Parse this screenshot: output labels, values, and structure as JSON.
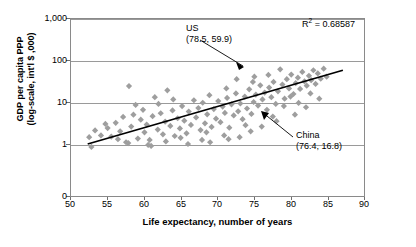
{
  "chart_data": {
    "type": "scatter",
    "title": "",
    "xlabel": "Life expectancy, number of years",
    "ylabel": "GDP per capita PPP (log-scale, int'l $ ,000)",
    "ylabel_line1": "GDP per capita PPP",
    "ylabel_line2": "(log-scale, int'l $ ,000)",
    "xlim": [
      50,
      90
    ],
    "ylim_log": [
      1,
      1000
    ],
    "x_ticks": [
      50,
      55,
      60,
      65,
      70,
      75,
      80,
      85,
      90
    ],
    "x_tick_labels": [
      "50",
      "55",
      "60",
      "65",
      "70",
      "75",
      "80",
      "85",
      "90"
    ],
    "y_ticks": [
      0,
      1,
      10,
      100,
      1000
    ],
    "y_tick_labels": [
      "0",
      "1",
      "10",
      "100",
      "1,000"
    ],
    "grid": true,
    "legend": "none",
    "r_squared_label": "R",
    "r_squared_exp": "2",
    "r_squared_value": " = 0.68587",
    "annotations": [
      {
        "name": "US",
        "label": "US",
        "coords": "(78.5, 59.9)",
        "x": 78.5,
        "y": 59.9
      },
      {
        "name": "China",
        "label": "China",
        "coords": "(76.4, 16.8)",
        "x": 76.4,
        "y": 16.8
      }
    ],
    "trendline": {
      "type": "linear-on-log",
      "x_start": 52.4,
      "y_start": 1.0,
      "x_end": 87.0,
      "y_end": 57.0
    },
    "marker_color": "#9e9e9e",
    "marker_shape": "diamond",
    "line_color": "#000000",
    "points": [
      [
        52.6,
        1.45
      ],
      [
        52.9,
        0.85
      ],
      [
        53.4,
        2.1
      ],
      [
        54.2,
        1.6
      ],
      [
        55.1,
        2.4
      ],
      [
        55.6,
        1.5
      ],
      [
        56.2,
        3.2
      ],
      [
        56.8,
        2.0
      ],
      [
        57.2,
        4.4
      ],
      [
        57.6,
        1.1
      ],
      [
        58.0,
        24.0
      ],
      [
        58.3,
        2.6
      ],
      [
        58.9,
        8.5
      ],
      [
        59.2,
        1.35
      ],
      [
        59.6,
        3.8
      ],
      [
        60.1,
        1.9
      ],
      [
        60.4,
        2.9
      ],
      [
        60.8,
        1.25
      ],
      [
        61.2,
        4.6
      ],
      [
        61.5,
        13.0
      ],
      [
        61.9,
        2.2
      ],
      [
        62.3,
        5.4
      ],
      [
        62.6,
        1.7
      ],
      [
        62.9,
        3.4
      ],
      [
        63.2,
        19.0
      ],
      [
        63.6,
        2.7
      ],
      [
        63.9,
        6.3
      ],
      [
        64.2,
        1.55
      ],
      [
        64.6,
        4.1
      ],
      [
        64.9,
        2.35
      ],
      [
        65.2,
        8.0
      ],
      [
        65.5,
        3.6
      ],
      [
        65.8,
        1.8
      ],
      [
        66.1,
        5.9
      ],
      [
        66.4,
        2.85
      ],
      [
        66.8,
        11.0
      ],
      [
        67.1,
        4.3
      ],
      [
        67.4,
        7.2
      ],
      [
        67.7,
        2.15
      ],
      [
        68.0,
        9.6
      ],
      [
        68.3,
        3.1
      ],
      [
        68.6,
        5.1
      ],
      [
        68.9,
        14.5
      ],
      [
        69.2,
        2.55
      ],
      [
        69.5,
        6.8
      ],
      [
        69.8,
        4.0
      ],
      [
        70.1,
        10.5
      ],
      [
        70.4,
        3.3
      ],
      [
        70.7,
        7.8
      ],
      [
        71.0,
        5.5
      ],
      [
        71.3,
        12.5
      ],
      [
        71.6,
        2.45
      ],
      [
        71.9,
        8.8
      ],
      [
        72.2,
        4.8
      ],
      [
        72.5,
        16.0
      ],
      [
        72.8,
        6.0
      ],
      [
        73.1,
        9.2
      ],
      [
        73.4,
        3.9
      ],
      [
        73.7,
        13.5
      ],
      [
        74.0,
        7.0
      ],
      [
        74.3,
        20.0
      ],
      [
        74.6,
        5.2
      ],
      [
        74.9,
        10.0
      ],
      [
        75.2,
        15.0
      ],
      [
        75.5,
        8.2
      ],
      [
        75.8,
        25.0
      ],
      [
        76.1,
        11.5
      ],
      [
        76.4,
        16.8
      ],
      [
        76.7,
        6.5
      ],
      [
        77.0,
        22.0
      ],
      [
        77.3,
        13.0
      ],
      [
        77.6,
        30.0
      ],
      [
        77.9,
        9.0
      ],
      [
        78.2,
        18.0
      ],
      [
        78.5,
        59.9
      ],
      [
        78.8,
        26.0
      ],
      [
        79.1,
        12.0
      ],
      [
        79.4,
        35.0
      ],
      [
        79.7,
        21.0
      ],
      [
        80.0,
        45.0
      ],
      [
        80.3,
        15.5
      ],
      [
        80.6,
        28.0
      ],
      [
        80.9,
        38.0
      ],
      [
        81.2,
        20.5
      ],
      [
        81.5,
        52.0
      ],
      [
        81.8,
        31.0
      ],
      [
        82.1,
        24.5
      ],
      [
        82.4,
        42.0
      ],
      [
        82.7,
        33.0
      ],
      [
        83.0,
        57.0
      ],
      [
        83.3,
        27.0
      ],
      [
        83.6,
        48.0
      ],
      [
        84.0,
        36.0
      ],
      [
        84.4,
        62.0
      ],
      [
        60.6,
        0.95
      ],
      [
        57.9,
        1.05
      ],
      [
        63.0,
        1.15
      ],
      [
        66.0,
        1.0
      ],
      [
        69.0,
        1.1
      ],
      [
        71.5,
        1.3
      ],
      [
        73.0,
        1.45
      ],
      [
        74.5,
        2.0
      ],
      [
        76.0,
        2.6
      ],
      [
        78.0,
        3.5
      ],
      [
        80.5,
        5.0
      ],
      [
        82.0,
        7.5
      ],
      [
        83.8,
        12.0
      ],
      [
        67.9,
        1.25
      ],
      [
        70.9,
        1.6
      ],
      [
        72.6,
        35.0
      ],
      [
        75.0,
        40.0
      ],
      [
        79.0,
        8.0
      ],
      [
        81.0,
        9.5
      ],
      [
        62.0,
        9.0
      ],
      [
        64.0,
        11.5
      ],
      [
        58.6,
        5.0
      ],
      [
        73.8,
        2.8
      ],
      [
        77.5,
        4.5
      ],
      [
        65.0,
        1.4
      ],
      [
        68.5,
        1.9
      ],
      [
        71.2,
        21.0
      ],
      [
        74.8,
        30.0
      ],
      [
        76.9,
        44.0
      ],
      [
        79.9,
        13.5
      ],
      [
        82.6,
        16.0
      ],
      [
        84.8,
        40.0
      ],
      [
        61.0,
        0.9
      ],
      [
        54.8,
        3.0
      ],
      [
        56.5,
        1.3
      ],
      [
        59.9,
        6.5
      ]
    ]
  }
}
